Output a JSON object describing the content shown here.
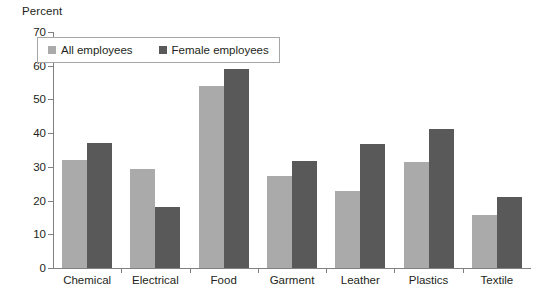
{
  "chart_data": {
    "type": "bar",
    "title": "",
    "subtitle": "",
    "xlabel": "",
    "ylabel": "Percent",
    "ylim": [
      0,
      70
    ],
    "yticks": [
      0,
      10,
      20,
      30,
      40,
      50,
      60,
      70
    ],
    "grid": false,
    "legend_position": "top-left",
    "categories": [
      "Chemical",
      "Electrical",
      "Food",
      "Garment",
      "Leather",
      "Plastics",
      "Textile"
    ],
    "series": [
      {
        "name": "All employees",
        "color": "#aaaaaa",
        "values": [
          32.0,
          29.5,
          54.0,
          27.3,
          22.8,
          31.4,
          15.7
        ]
      },
      {
        "name": "Female employees",
        "color": "#595959",
        "values": [
          37.0,
          18.0,
          59.0,
          31.7,
          36.8,
          41.2,
          21.0
        ]
      }
    ]
  },
  "axis": {
    "y_caption": "Percent"
  },
  "colors": {
    "axis": "#808080",
    "text": "#231f20",
    "legend_border": "#a6a6a6",
    "background": "#ffffff"
  }
}
